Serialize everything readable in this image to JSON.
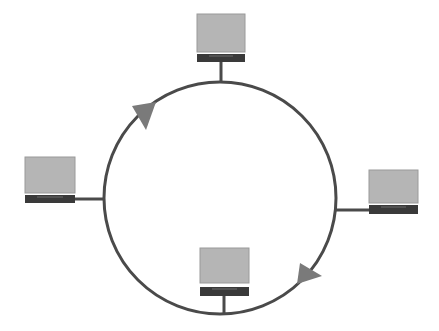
{
  "diagram": {
    "type": "ring-network-topology",
    "colors": {
      "background": "#ffffff",
      "ring": "#4a4a4a",
      "screen": "#b5b5b5",
      "screen_border": "#9a9a9a",
      "base": "#3a3a3a",
      "arrow": "#7a7a7a"
    },
    "ring": {
      "cx": 220,
      "cy": 198,
      "r": 116
    },
    "nodes": [
      {
        "id": "top",
        "screen": [
          197,
          14,
          48,
          38
        ],
        "base": [
          197,
          54,
          48,
          8
        ],
        "link": [
          221,
          62,
          221,
          82
        ]
      },
      {
        "id": "left",
        "screen": [
          25,
          157,
          50,
          36
        ],
        "base": [
          25,
          195,
          50,
          8
        ],
        "link": [
          75,
          199,
          105,
          199
        ]
      },
      {
        "id": "right",
        "screen": [
          369,
          170,
          49,
          33
        ],
        "base": [
          369,
          205,
          49,
          9
        ],
        "link": [
          336,
          210,
          369,
          210
        ]
      },
      {
        "id": "bottom",
        "screen": [
          200,
          248,
          49,
          35
        ],
        "base": [
          200,
          287,
          49,
          9
        ],
        "link": [
          224,
          296,
          224,
          314
        ]
      }
    ],
    "arrows": [
      {
        "id": "arrow-upper-left",
        "points": "132,106 156,102 146,130"
      },
      {
        "id": "arrow-lower-right",
        "points": "300,263 322,276 297,284"
      }
    ]
  }
}
